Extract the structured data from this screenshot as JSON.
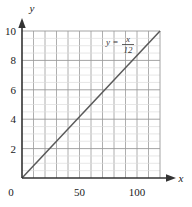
{
  "chart_data": {
    "type": "line",
    "title": "",
    "xlabel": "x",
    "ylabel": "y",
    "equation_label": "y = x/12",
    "equation_parts": {
      "lhs": "y",
      "operator": "=",
      "numerator": "x",
      "denominator": "12"
    },
    "xlim": [
      0,
      120
    ],
    "ylim": [
      0,
      10
    ],
    "x_ticks": [
      0,
      50,
      100
    ],
    "x_tick_labels": [
      "0",
      "50",
      "100"
    ],
    "y_ticks": [
      0,
      2,
      4,
      6,
      8,
      10
    ],
    "y_tick_labels": [
      "0",
      "2",
      "4",
      "6",
      "8",
      "10"
    ],
    "x_minor_step": 10,
    "y_minor_step": 0.5,
    "y_major_step": 2,
    "grid": true,
    "legend_position": "none",
    "series": [
      {
        "name": "y = x/12",
        "x": [
          0,
          120
        ],
        "values": [
          0,
          10
        ],
        "slope": 0.0833,
        "intercept": 0,
        "color": "#595959"
      }
    ]
  },
  "style": {
    "axis_color": "#333333",
    "major_grid_color": "#9a9a9a",
    "minor_grid_color": "#dcdcdc",
    "line_color": "#5e5e5e",
    "background": "#ffffff"
  },
  "icons": {
    "x_axis_arrow": "arrow-right-icon",
    "y_axis_arrow": "arrow-up-icon"
  }
}
